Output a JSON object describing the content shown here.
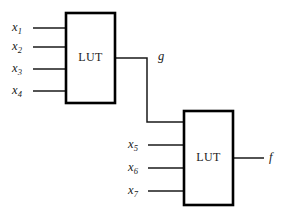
{
  "diagram": {
    "type": "logic-block-diagram",
    "colors": {
      "background": "#ffffff",
      "box_stroke": "#000000",
      "wire_stroke": "#1a1a1a",
      "text": "#1a1a1a"
    },
    "blocks": [
      {
        "id": "lut1",
        "label": "LUT",
        "x": 66,
        "y": 13,
        "width": 49,
        "height": 90,
        "inputs": [
          "x1",
          "x2",
          "x3",
          "x4"
        ],
        "outputs": [
          "g"
        ]
      },
      {
        "id": "lut2",
        "label": "LUT",
        "x": 184,
        "y": 111,
        "width": 49,
        "height": 94,
        "inputs": [
          "g",
          "x5",
          "x6",
          "x7"
        ],
        "outputs": [
          "f"
        ]
      }
    ],
    "signals": {
      "x1": {
        "base": "x",
        "sub": "1",
        "x": 12,
        "y": 21
      },
      "x2": {
        "base": "x",
        "sub": "2",
        "x": 12,
        "y": 40
      },
      "x3": {
        "base": "x",
        "sub": "3",
        "x": 12,
        "y": 62
      },
      "x4": {
        "base": "x",
        "sub": "4",
        "x": 12,
        "y": 84
      },
      "x5": {
        "base": "x",
        "sub": "5",
        "x": 128,
        "y": 138
      },
      "x6": {
        "base": "x",
        "sub": "6",
        "x": 128,
        "y": 161
      },
      "x7": {
        "base": "x",
        "sub": "7",
        "x": 128,
        "y": 184
      },
      "g": {
        "base": "g",
        "sub": "",
        "x": 158,
        "y": 50
      },
      "f": {
        "base": "f",
        "sub": "",
        "x": 269,
        "y": 151
      }
    },
    "wires": [
      {
        "name": "x1-to-lut1",
        "d": "M 33 28 L 67 28"
      },
      {
        "name": "x2-to-lut1",
        "d": "M 33 47 L 67 47"
      },
      {
        "name": "x3-to-lut1",
        "d": "M 33 69 L 67 69"
      },
      {
        "name": "x4-to-lut1",
        "d": "M 33 91 L 67 91"
      },
      {
        "name": "g-net",
        "d": "M 114 58 L 147 58 L 147 122 L 185 122"
      },
      {
        "name": "x5-to-lut2",
        "d": "M 148 145 L 185 145"
      },
      {
        "name": "x6-to-lut2",
        "d": "M 148 168 L 185 168"
      },
      {
        "name": "x7-to-lut2",
        "d": "M 148 191 L 185 191"
      },
      {
        "name": "f-out",
        "d": "M 232 158 L 264 158"
      }
    ]
  }
}
